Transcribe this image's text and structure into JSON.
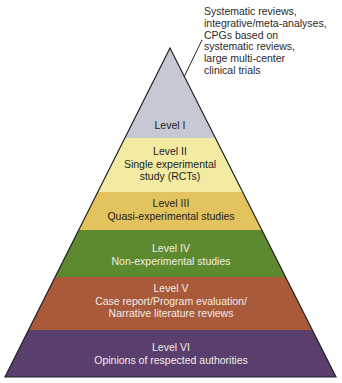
{
  "annotation": {
    "text": "Systematic reviews,\nintegrative/meta-analyses,\nCPGs based on\nsystematic reviews,\nlarge multi-center\nclinical trials"
  },
  "pyramid": {
    "levels": [
      {
        "level": "Level I",
        "description": "",
        "color": "#c6c9d4",
        "text_color": "#222222"
      },
      {
        "level": "Level II",
        "description": "Single experimental\nstudy (RCTs)",
        "color": "#f4eba2",
        "text_color": "#222222"
      },
      {
        "level": "Level III",
        "description": "Quasi-experimental studies",
        "color": "#e2c35e",
        "text_color": "#222222"
      },
      {
        "level": "Level IV",
        "description": "Non-experimental studies",
        "color": "#5e8a2f",
        "text_color": "#f1ede6"
      },
      {
        "level": "Level V",
        "description": "Case report/Program evaluation/\nNarrative literature reviews",
        "color": "#a85a3b",
        "text_color": "#f1ede6"
      },
      {
        "level": "Level VI",
        "description": "Opinions of respected authorities",
        "color": "#5a3f6e",
        "text_color": "#f1ede6"
      }
    ]
  }
}
